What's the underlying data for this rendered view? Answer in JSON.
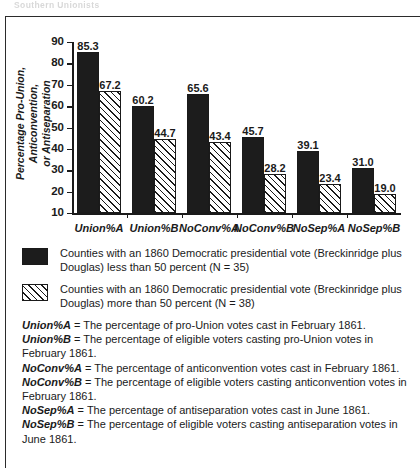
{
  "page": {
    "header_ghost": "Southern Unionists"
  },
  "chart_data": {
    "type": "bar",
    "title": "",
    "xlabel": "",
    "ylabel": "Percentage Pro-Union, Anticonvention, or Antiseparation",
    "ylabel_line1": "Percentage Pro-Union, Anticonvention,",
    "ylabel_line2": "or Antiseparation",
    "ylim": [
      10,
      90
    ],
    "yticks": [
      10,
      20,
      30,
      40,
      50,
      60,
      70,
      80,
      90
    ],
    "grid": false,
    "legend_position": "below",
    "categories": [
      "Union%A",
      "Union%B",
      "NoConv%A",
      "NoConv%B",
      "NoSep%A",
      "NoSep%B"
    ],
    "series": [
      {
        "name": "Counties with an 1860 Democratic presidential vote (Breckinridge plus Douglas) less than 50 percent (N = 35)",
        "fill": "solid",
        "values": [
          85.3,
          65.6,
          45.7,
          39.1,
          31.0,
          null
        ]
      },
      {
        "name": "Counties with an 1860 Democratic presidential vote (Breckinridge plus Douglas) more than 50 percent (N = 38)",
        "fill": "hatched",
        "values": [
          67.2,
          44.7,
          43.4,
          28.2,
          23.4,
          19.0
        ]
      }
    ],
    "bars": [
      {
        "category": "Union%A",
        "fill": "solid",
        "value": 85.3,
        "label": "85.3"
      },
      {
        "category": "Union%A",
        "fill": "hatched",
        "value": 67.2,
        "label": "67.2"
      },
      {
        "category": "Union%B",
        "fill": "solid",
        "value": 60.2,
        "label": "60.2"
      },
      {
        "category": "Union%B",
        "fill": "hatched",
        "value": 44.7,
        "label": "44.7"
      },
      {
        "category": "NoConv%A",
        "fill": "solid",
        "value": 65.6,
        "label": "65.6"
      },
      {
        "category": "NoConv%A",
        "fill": "hatched",
        "value": 43.4,
        "label": "43.4"
      },
      {
        "category": "NoConv%B",
        "fill": "solid",
        "value": 45.7,
        "label": "45.7"
      },
      {
        "category": "NoConv%B",
        "fill": "hatched",
        "value": 28.2,
        "label": "28.2"
      },
      {
        "category": "NoSep%A",
        "fill": "solid",
        "value": 39.1,
        "label": "39.1"
      },
      {
        "category": "NoSep%A",
        "fill": "hatched",
        "value": 23.4,
        "label": "23.4"
      },
      {
        "category": "NoSep%B",
        "fill": "solid",
        "value": 31.0,
        "label": "31.0"
      },
      {
        "category": "NoSep%B",
        "fill": "hatched",
        "value": 19.0,
        "label": "19.0"
      }
    ],
    "colors": {
      "series_a": "#1c1c1c",
      "series_b": "#ffffff",
      "axis": "#1a1a1a"
    }
  },
  "legend": {
    "items": [
      {
        "swatch": "solid",
        "text": "Counties with an 1860 Democratic presidential vote (Breckinridge plus Douglas) less than 50 percent (N = 35)"
      },
      {
        "swatch": "hatched",
        "text": "Counties with an 1860 Democratic presidential vote (Breckinridge plus Douglas) more than 50 percent (N = 38)"
      }
    ]
  },
  "definitions": [
    {
      "term": "Union%A",
      "text": " = The percentage of pro-Union votes cast in February 1861."
    },
    {
      "term": "Union%B",
      "text": " = The percentage of eligible voters casting pro-Union votes in February 1861."
    },
    {
      "term": "NoConv%A",
      "text": " = The percentage of anticonvention votes cast in February 1861."
    },
    {
      "term": "NoConv%B",
      "text": " = The percentage of eligible voters casting anticonvention votes in February 1861."
    },
    {
      "term": "NoSep%A",
      "text": " = The percentage of antiseparation votes cast in June 1861."
    },
    {
      "term": "NoSep%B",
      "text": " = The percentage of eligible voters casting antiseparation votes in June 1861."
    }
  ]
}
